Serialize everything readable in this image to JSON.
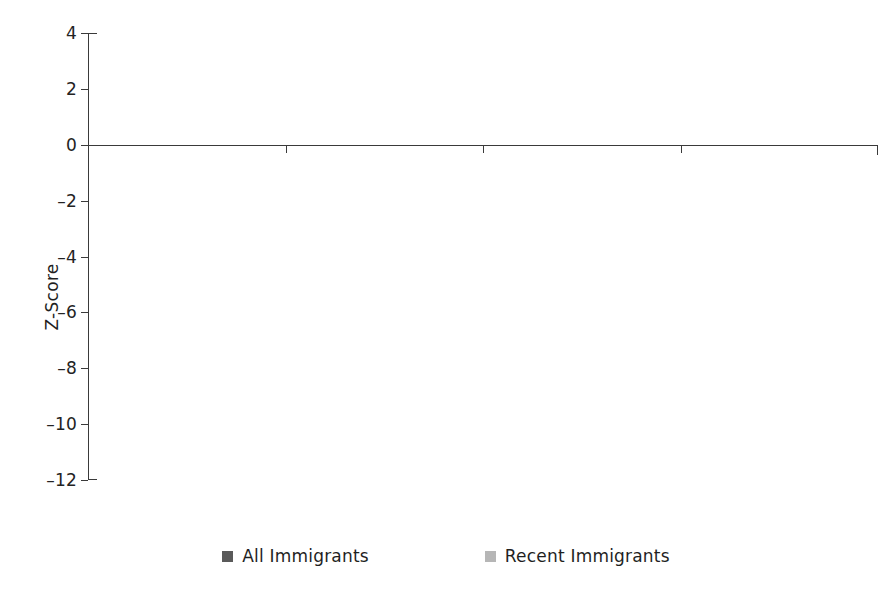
{
  "chart_data": {
    "type": "bar",
    "title": "",
    "xlabel": "",
    "ylabel": "Z-Score",
    "ylim": [
      -12,
      4
    ],
    "yticks": [
      "4",
      "2",
      "0",
      "–2",
      "–4",
      "–6",
      "–8",
      "–10",
      "–12"
    ],
    "ytick_values": [
      4,
      2,
      0,
      -2,
      -4,
      -6,
      -8,
      -10,
      -12
    ],
    "grid": false,
    "legend_position": "bottom",
    "categories": [
      "Total",
      "Violent",
      "Drug",
      "Property"
    ],
    "series": [
      {
        "name": "All Immigrants",
        "color": "#5a5a5a",
        "values": [
          -9.96,
          -3.57,
          -10.95,
          -3.82
        ],
        "labels": [
          "–9.96",
          "–3.57",
          "–10.95",
          "–3.82"
        ]
      },
      {
        "name": "Recent Immigrants",
        "color": "#b6b6b6",
        "values": [
          -4.01,
          1.48,
          -4.85,
          -1.52
        ],
        "labels": [
          "–4.01",
          "1.48",
          "–4.85",
          "–1.52"
        ]
      }
    ]
  },
  "axis": {
    "y_title": "Z-Score",
    "ticks": [
      {
        "label": "4",
        "value": 4
      },
      {
        "label": "2",
        "value": 2
      },
      {
        "label": "0",
        "value": 0
      },
      {
        "label": "–2",
        "value": -2
      },
      {
        "label": "–4",
        "value": -4
      },
      {
        "label": "–6",
        "value": -6
      },
      {
        "label": "–8",
        "value": -8
      },
      {
        "label": "–10",
        "value": -10
      },
      {
        "label": "–12",
        "value": -12
      }
    ]
  },
  "categories": [
    {
      "label": "Total"
    },
    {
      "label": "Violent"
    },
    {
      "label": "Drug"
    },
    {
      "label": "Property"
    }
  ],
  "legend": {
    "items": [
      {
        "label": "All Immigrants",
        "color": "#5a5a5a"
      },
      {
        "label": "Recent Immigrants",
        "color": "#b6b6b6"
      }
    ]
  },
  "colors": {
    "all_immigrants": "#5a5a5a",
    "recent_immigrants": "#b6b6b6",
    "axis": "#3a3a3a",
    "text": "#1f1f1f",
    "background": "#ffffff"
  }
}
